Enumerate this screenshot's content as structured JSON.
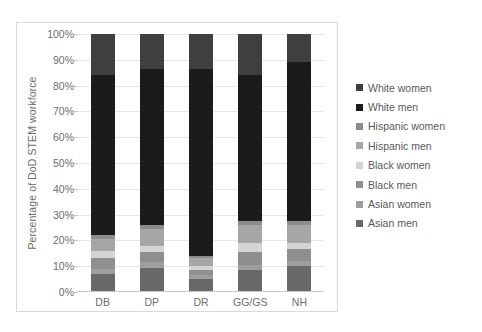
{
  "chart_data": {
    "type": "bar",
    "subtype": "stacked-percent-column",
    "title": "",
    "xlabel": "",
    "ylabel": "Percentage of DoD STEM workforce",
    "ylim": [
      0,
      100
    ],
    "ytick_labels": [
      "0%",
      "10%",
      "20%",
      "30%",
      "40%",
      "50%",
      "60%",
      "70%",
      "80%",
      "90%",
      "100%"
    ],
    "ytick_values": [
      0,
      10,
      20,
      30,
      40,
      50,
      60,
      70,
      80,
      90,
      100
    ],
    "grid": true,
    "legend_position": "right",
    "categories": [
      "DB",
      "DP",
      "DR",
      "GG/GS",
      "NH"
    ],
    "stack_order_bottom_to_top": [
      "Asian men",
      "Asian women",
      "Black men",
      "Black women",
      "Hispanic men",
      "Hispanic women",
      "White men",
      "White women"
    ],
    "series": [
      {
        "name": "White women",
        "color": "#3f3f3f",
        "values": [
          16.0,
          13.5,
          13.5,
          16.0,
          11.0
        ]
      },
      {
        "name": "White men",
        "color": "#1b1b1b",
        "values": [
          62.0,
          60.5,
          72.5,
          56.5,
          61.5
        ]
      },
      {
        "name": "Hispanic women",
        "color": "#8c8c8c",
        "values": [
          1.5,
          1.5,
          1.0,
          1.5,
          1.5
        ]
      },
      {
        "name": "Hispanic men",
        "color": "#a6a6a6",
        "values": [
          4.5,
          6.5,
          3.0,
          7.0,
          7.0
        ]
      },
      {
        "name": "Black women",
        "color": "#d4d4d4",
        "values": [
          3.0,
          2.5,
          1.5,
          3.5,
          2.5
        ]
      },
      {
        "name": "Black men",
        "color": "#8f8f8f",
        "values": [
          4.0,
          4.0,
          2.0,
          5.0,
          4.5
        ]
      },
      {
        "name": "Asian women",
        "color": "#9e9e9e",
        "values": [
          2.0,
          2.0,
          1.5,
          2.0,
          2.0
        ]
      },
      {
        "name": "Asian men",
        "color": "#696969",
        "values": [
          7.0,
          9.5,
          5.0,
          8.5,
          10.0
        ]
      }
    ]
  },
  "legend": {
    "items": [
      {
        "label": "White women",
        "color": "#3f3f3f"
      },
      {
        "label": "White men",
        "color": "#1b1b1b"
      },
      {
        "label": "Hispanic women",
        "color": "#8c8c8c"
      },
      {
        "label": "Hispanic men",
        "color": "#a6a6a6"
      },
      {
        "label": "Black women",
        "color": "#d4d4d4"
      },
      {
        "label": "Black men",
        "color": "#8f8f8f"
      },
      {
        "label": "Asian women",
        "color": "#9e9e9e"
      },
      {
        "label": "Asian men",
        "color": "#696969"
      }
    ]
  }
}
